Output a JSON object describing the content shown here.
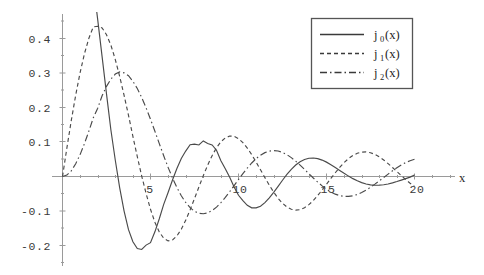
{
  "chart_data": {
    "type": "line",
    "title": "",
    "subtitle": "",
    "xlabel": "x",
    "ylabel": "",
    "xlim": [
      -0.6,
      21.8
    ],
    "ylim": [
      -0.225,
      0.475
    ],
    "grid": false,
    "legend_position": "top-right",
    "xticks": [
      5,
      10,
      15,
      20
    ],
    "xtick_labels": [
      "5",
      "10",
      "15",
      "20"
    ],
    "yticks": [
      0.4,
      0.3,
      0.2,
      0.1,
      -0.1,
      -0.2
    ],
    "ytick_labels": [
      "0.4",
      "0.3",
      "0.2",
      "0.1",
      "-0.1",
      "-0.2"
    ],
    "x": [
      0,
      0.25,
      0.5,
      0.75,
      1,
      1.25,
      1.5,
      1.75,
      2,
      2.25,
      2.5,
      2.75,
      3,
      3.25,
      3.5,
      3.75,
      4,
      4.25,
      4.5,
      4.75,
      5,
      5.25,
      5.5,
      5.75,
      6,
      6.25,
      6.5,
      6.75,
      7,
      7.25,
      7.5,
      7.75,
      8,
      8.25,
      8.5,
      8.75,
      9,
      9.25,
      9.5,
      9.75,
      10,
      10.25,
      10.5,
      10.75,
      11,
      11.25,
      11.5,
      11.75,
      12,
      12.25,
      12.5,
      12.75,
      13,
      13.25,
      13.5,
      13.75,
      14,
      14.25,
      14.5,
      14.75,
      15,
      15.25,
      15.5,
      15.75,
      16,
      16.25,
      16.5,
      16.75,
      17,
      17.25,
      17.5,
      17.75,
      18,
      18.25,
      18.5,
      18.75,
      19,
      19.25,
      19.5,
      19.75,
      20
    ],
    "series": [
      {
        "name": "j0(x)",
        "style": "solid",
        "color": "#4a4a4a",
        "values": [
          1,
          0.98972,
          0.95885,
          0.90885,
          0.84147,
          0.75874,
          0.6645,
          0.55943,
          0.45465,
          0.34731,
          0.23939,
          0.13472,
          0.04704,
          -0.03275,
          -0.10022,
          -0.15403,
          -0.1892,
          -0.20897,
          -0.21155,
          -0.19889,
          -0.19178,
          -0.16031,
          -0.12238,
          -0.08078,
          -0.04656,
          -0.01,
          0.02334,
          0.05199,
          0.07368,
          0.09195,
          0.09385,
          0.0914,
          0.1031,
          0.09568,
          0.09141,
          0.0763,
          0.04579,
          0.0227,
          -0.00247,
          -0.03049,
          -0.0544,
          -0.0702,
          -0.08345,
          -0.09075,
          -0.09102,
          -0.0862,
          -0.0757,
          -0.0617,
          -0.04594,
          -0.02867,
          -0.0109,
          0.0059,
          0.02069,
          0.03322,
          0.0428,
          0.04936,
          0.05294,
          0.05369,
          0.0517,
          0.04754,
          0.04165,
          0.03435,
          0.02613,
          0.0176,
          0.00912,
          0.0011,
          -0.0062,
          -0.01253,
          -0.0177,
          -0.02159,
          -0.02412,
          -0.02531,
          -0.0252,
          -0.02392,
          -0.02162,
          -0.01848,
          -0.0147,
          -0.01053,
          -0.00618,
          -0.00183,
          0.00455
        ]
      },
      {
        "name": "j1(x)",
        "style": "dashed",
        "color": "#4a4a4a",
        "values": [
          0,
          0.083,
          0.16253,
          0.23591,
          0.30117,
          0.35643,
          0.40089,
          0.43372,
          0.43539,
          0.43073,
          0.41088,
          0.38069,
          0.339,
          0.28967,
          0.235,
          0.1775,
          0.11611,
          0.0577,
          0.0014,
          -0.04926,
          -0.09508,
          -0.13263,
          -0.16084,
          -0.17901,
          -0.18661,
          -0.184,
          -0.17222,
          -0.15281,
          -0.12709,
          -0.09686,
          -0.064,
          -0.03037,
          0.0026,
          0.0331,
          0.06045,
          0.0833,
          0.1006,
          0.112,
          0.11718,
          0.11638,
          0.10983,
          0.0983,
          0.08249,
          0.0634,
          0.04201,
          0.0194,
          -0.0032,
          -0.025,
          -0.0454,
          -0.0631,
          -0.0776,
          -0.0884,
          -0.095,
          -0.0976,
          -0.096,
          -0.0905,
          -0.0816,
          -0.0696,
          -0.0552,
          -0.0392,
          -0.0224,
          -0.0055,
          0.0109,
          0.0264,
          0.0403,
          0.052,
          0.061,
          0.0673,
          0.0707,
          0.0712,
          0.0689,
          0.064,
          0.0568,
          0.0478,
          0.0373,
          0.026,
          0.0142,
          0.0026,
          -0.0088,
          -0.0194,
          -0.029
        ]
      },
      {
        "name": "j2(x)",
        "style": "dashdot",
        "color": "#4a4a4a",
        "values": [
          0,
          0.00416,
          0.01652,
          0.0367,
          0.0635,
          0.0957,
          0.1318,
          0.1701,
          0.198,
          0.2338,
          0.2613,
          0.2824,
          0.297,
          0.3032,
          0.3003,
          0.292,
          0.276,
          0.255,
          0.229,
          0.199,
          0.1661,
          0.1311,
          0.0953,
          0.06,
          0.0265,
          -0.0044,
          -0.032,
          -0.0558,
          -0.0753,
          -0.0904,
          -0.1008,
          -0.1067,
          -0.108,
          -0.1053,
          -0.0987,
          -0.0887,
          -0.0758,
          -0.0607,
          -0.044,
          -0.0265,
          -0.0088,
          0.0084,
          0.0246,
          0.0392,
          0.0518,
          0.0619,
          0.0692,
          0.0736,
          0.0751,
          0.0738,
          0.0698,
          0.0634,
          0.0548,
          0.0445,
          0.0329,
          0.0206,
          0.008,
          -0.0044,
          -0.0162,
          -0.0272,
          -0.0368,
          -0.0449,
          -0.0512,
          -0.0555,
          -0.0577,
          -0.0578,
          -0.0559,
          -0.0521,
          -0.0465,
          -0.0395,
          -0.0313,
          -0.0222,
          -0.0126,
          -0.0028,
          0.007,
          0.0165,
          0.0254,
          0.0334,
          0.0403,
          0.0458,
          0.0498
        ]
      }
    ]
  },
  "legend": {
    "entries": [
      {
        "base": "j",
        "sub": "0",
        "arg": "(x)",
        "label": "j0(x)",
        "style": "solid"
      },
      {
        "base": "j",
        "sub": "1",
        "arg": "(x)",
        "label": "j1(x)",
        "style": "dashed"
      },
      {
        "base": "j",
        "sub": "2",
        "arg": "(x)",
        "label": "j2(x)",
        "style": "dashdot"
      }
    ]
  },
  "axes": {
    "x_axis_label": "x",
    "x_tick_labels": [
      "5",
      "10",
      "15",
      "20"
    ],
    "y_tick_labels": [
      "0.4",
      "0.3",
      "0.2",
      "0.1",
      "-0.1",
      "-0.2"
    ]
  },
  "colors": {
    "background": "#ffffff",
    "curve": "#4a4a4a",
    "axis": "#9a9a9a",
    "text": "#2b2b2b",
    "legend_border": "#555555"
  }
}
